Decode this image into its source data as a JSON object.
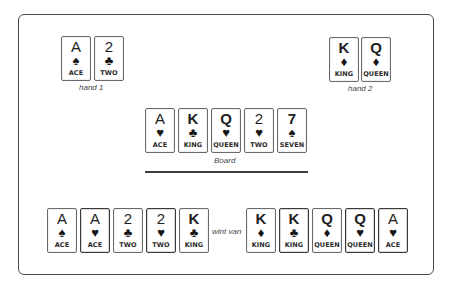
{
  "hand1": {
    "label": "hand 1",
    "cards": [
      {
        "rank": "A",
        "suit": "♠",
        "suit_name": "spade",
        "name": "ACE"
      },
      {
        "rank": "2",
        "suit": "♣",
        "suit_name": "club",
        "name": "TWO"
      }
    ]
  },
  "hand2": {
    "label": "hand 2",
    "cards": [
      {
        "rank": "K",
        "suit": "♦",
        "suit_name": "diamond",
        "name": "KING"
      },
      {
        "rank": "Q",
        "suit": "♦",
        "suit_name": "diamond",
        "name": "QUEEN"
      }
    ]
  },
  "board": {
    "label": "Board",
    "cards": [
      {
        "rank": "A",
        "suit": "♥",
        "suit_name": "heart",
        "name": "ACE"
      },
      {
        "rank": "K",
        "suit": "♣",
        "suit_name": "club",
        "name": "KING"
      },
      {
        "rank": "Q",
        "suit": "♥",
        "suit_name": "heart",
        "name": "QUEEN"
      },
      {
        "rank": "2",
        "suit": "♥",
        "suit_name": "heart",
        "name": "TWO"
      },
      {
        "rank": "7",
        "suit": "♠",
        "suit_name": "spade",
        "name": "SEVEN"
      }
    ]
  },
  "result": {
    "connector": "wint van",
    "winner_cards": [
      {
        "rank": "A",
        "suit": "♠",
        "suit_name": "spade",
        "name": "ACE",
        "from_board": false
      },
      {
        "rank": "A",
        "suit": "♥",
        "suit_name": "heart",
        "name": "ACE",
        "from_board": true
      },
      {
        "rank": "2",
        "suit": "♣",
        "suit_name": "club",
        "name": "TWO",
        "from_board": false
      },
      {
        "rank": "2",
        "suit": "♥",
        "suit_name": "heart",
        "name": "TWO",
        "from_board": true
      },
      {
        "rank": "K",
        "suit": "♣",
        "suit_name": "club",
        "name": "KING",
        "from_board": true
      }
    ],
    "loser_cards": [
      {
        "rank": "K",
        "suit": "♦",
        "suit_name": "diamond",
        "name": "KING",
        "from_board": false
      },
      {
        "rank": "K",
        "suit": "♣",
        "suit_name": "club",
        "name": "KING",
        "from_board": true
      },
      {
        "rank": "Q",
        "suit": "♦",
        "suit_name": "diamond",
        "name": "QUEEN",
        "from_board": false
      },
      {
        "rank": "Q",
        "suit": "♥",
        "suit_name": "heart",
        "name": "QUEEN",
        "from_board": true
      },
      {
        "rank": "A",
        "suit": "♥",
        "suit_name": "heart",
        "name": "ACE",
        "from_board": true
      }
    ]
  }
}
